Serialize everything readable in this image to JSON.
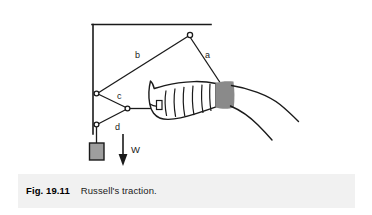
{
  "figure": {
    "caption_label": "Fig. 19.11",
    "caption_title": "Russell's traction.",
    "labels": {
      "rope_a": "a",
      "rope_b": "b",
      "rope_c": "c",
      "rope_d": "d",
      "weight": "W"
    },
    "colors": {
      "line": "#1a1a1a",
      "weight_fill": "#9e9e9e",
      "thigh_band_fill": "#8a8a8a",
      "caption_band": "#f1f1f1",
      "page_background": "#ffffff"
    },
    "elements": {
      "ceiling_bar": "ceiling-bar",
      "vertical_post": "vertical-post",
      "top_pulley": "top-pulley",
      "upper_side_pulley": "upper-side-pulley",
      "lower_side_pulley": "lower-side-pulley",
      "foot_pulley": "foot-pulley",
      "weight_block": "weight-block",
      "weight_arrow": "weight-arrow",
      "leg_cast": "leg-in-cast",
      "thigh_band": "thigh-band",
      "body_outline": "body-outline"
    }
  }
}
